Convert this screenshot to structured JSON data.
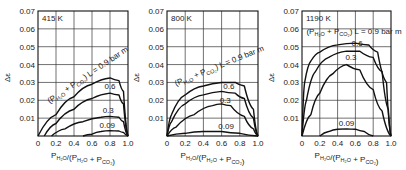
{
  "chart_data": [
    {
      "type": "line",
      "title": "415 K",
      "xlabel": "P_H2O/(P_H2O + P_CO2)",
      "ylabel": "Δε",
      "xlim": [
        0,
        1.0
      ],
      "ylim": [
        0,
        0.07
      ],
      "xticks": [
        "0",
        "0.2",
        "0.4",
        "0.6",
        "0.8",
        "1.0"
      ],
      "yticks": [
        "0.01",
        "0.02",
        "0.03",
        "0.04",
        "0.05",
        "0.06",
        "0.07"
      ],
      "grid": true,
      "annotation": "(P_H2O + P_CO2) L = 0.9 bar m",
      "series": [
        {
          "name": "0.9",
          "x": [
            0.0,
            0.2,
            0.4,
            0.6,
            0.8,
            0.9,
            0.95,
            1.0
          ],
          "y": [
            0.0,
            0.012,
            0.022,
            0.029,
            0.0325,
            0.031,
            0.025,
            0.0
          ]
        },
        {
          "name": "0.6",
          "x": [
            0.07,
            0.2,
            0.4,
            0.6,
            0.8,
            0.9,
            0.95,
            1.0
          ],
          "y": [
            0.0,
            0.007,
            0.015,
            0.021,
            0.024,
            0.023,
            0.018,
            0.0
          ]
        },
        {
          "name": "0.3",
          "x": [
            0.15,
            0.3,
            0.5,
            0.7,
            0.8,
            0.9,
            0.95,
            1.0
          ],
          "y": [
            0.0,
            0.004,
            0.008,
            0.0105,
            0.011,
            0.0105,
            0.008,
            0.0
          ]
        },
        {
          "name": "0.09",
          "x": [
            0.5,
            0.6,
            0.7,
            0.8,
            0.9,
            0.95,
            1.0
          ],
          "y": [
            0.0,
            0.001,
            0.0025,
            0.003,
            0.0028,
            0.002,
            0.0
          ]
        }
      ]
    },
    {
      "type": "line",
      "title": "800 K",
      "xlabel": "P_H2O/(P_H2O + P_CO2)",
      "ylabel": "Δε",
      "xlim": [
        0,
        1.0
      ],
      "ylim": [
        0,
        0.07
      ],
      "xticks": [
        "0",
        "0.2",
        "0.4",
        "0.6",
        "0.8",
        "1.0"
      ],
      "yticks": [
        "0.01",
        "0.02",
        "0.03",
        "0.04",
        "0.05",
        "0.06",
        "0.07"
      ],
      "grid": true,
      "annotation": "(P_H2O + P_CO2) L = 0.9 bar m",
      "series": [
        {
          "name": "0.9",
          "x": [
            0.0,
            0.05,
            0.2,
            0.4,
            0.6,
            0.75,
            0.85,
            0.95,
            1.0
          ],
          "y": [
            0.0,
            0.012,
            0.023,
            0.028,
            0.03,
            0.03,
            0.028,
            0.015,
            0.0
          ]
        },
        {
          "name": "0.6",
          "x": [
            0.0,
            0.05,
            0.2,
            0.4,
            0.6,
            0.75,
            0.85,
            0.95,
            1.0
          ],
          "y": [
            0.0,
            0.008,
            0.018,
            0.023,
            0.025,
            0.024,
            0.021,
            0.01,
            0.0
          ]
        },
        {
          "name": "0.3",
          "x": [
            0.0,
            0.1,
            0.3,
            0.5,
            0.6,
            0.7,
            0.85,
            0.95,
            1.0
          ],
          "y": [
            0.0,
            0.005,
            0.012,
            0.017,
            0.018,
            0.017,
            0.011,
            0.004,
            0.0
          ]
        },
        {
          "name": "0.09",
          "x": [
            0.0,
            0.2,
            0.4,
            0.6,
            0.8,
            1.0
          ],
          "y": [
            0.0,
            0.0015,
            0.0025,
            0.0025,
            0.0015,
            0.0
          ]
        }
      ]
    },
    {
      "type": "line",
      "title": "1190 K",
      "xlabel": "P_H2O/(P_H2O + P_CO2)",
      "ylabel": "Δε",
      "xlim": [
        0,
        1.0
      ],
      "ylim": [
        0,
        0.07
      ],
      "xticks": [
        "0",
        "0.2",
        "0.4",
        "0.6",
        "0.8",
        "1.0"
      ],
      "yticks": [
        "0.01",
        "0.02",
        "0.03",
        "0.04",
        "0.05",
        "0.06",
        "0.07"
      ],
      "grid": true,
      "annotation": "(P_H2O + P_CO2) L = 0.9 bar m",
      "series": [
        {
          "name": "0.9",
          "x": [
            0.0,
            0.03,
            0.1,
            0.2,
            0.4,
            0.6,
            0.75,
            0.85,
            0.95,
            1.0
          ],
          "y": [
            0.0,
            0.03,
            0.042,
            0.047,
            0.051,
            0.052,
            0.051,
            0.047,
            0.03,
            0.0
          ]
        },
        {
          "name": "0.6",
          "x": [
            0.0,
            0.05,
            0.15,
            0.3,
            0.5,
            0.65,
            0.8,
            0.9,
            0.97,
            1.0
          ],
          "y": [
            0.0,
            0.02,
            0.036,
            0.044,
            0.0475,
            0.0475,
            0.044,
            0.036,
            0.015,
            0.0
          ]
        },
        {
          "name": "0.3",
          "x": [
            0.0,
            0.1,
            0.2,
            0.35,
            0.5,
            0.65,
            0.8,
            0.9,
            1.0
          ],
          "y": [
            0.0,
            0.012,
            0.024,
            0.035,
            0.04,
            0.037,
            0.026,
            0.014,
            0.0
          ]
        },
        {
          "name": "0.09",
          "x": [
            0.2,
            0.3,
            0.4,
            0.5,
            0.6,
            0.7,
            0.8
          ],
          "y": [
            0.0,
            0.0025,
            0.0038,
            0.004,
            0.0038,
            0.0025,
            0.0
          ]
        }
      ]
    }
  ],
  "ui": {
    "panel_labels": [
      "415 K",
      "800 K",
      "1190 K"
    ],
    "curve_labels": {
      "p1": [
        "0.6",
        "0.3",
        "0.09"
      ],
      "p2": [
        "0.6",
        "0.3",
        "0.09"
      ],
      "p3": [
        "0.6",
        "0.3",
        "0.09"
      ]
    },
    "y_axis_label": "Δε",
    "annotation_prefix": "(P",
    "annotation_suffix": ") L = 0.9 bar m"
  }
}
